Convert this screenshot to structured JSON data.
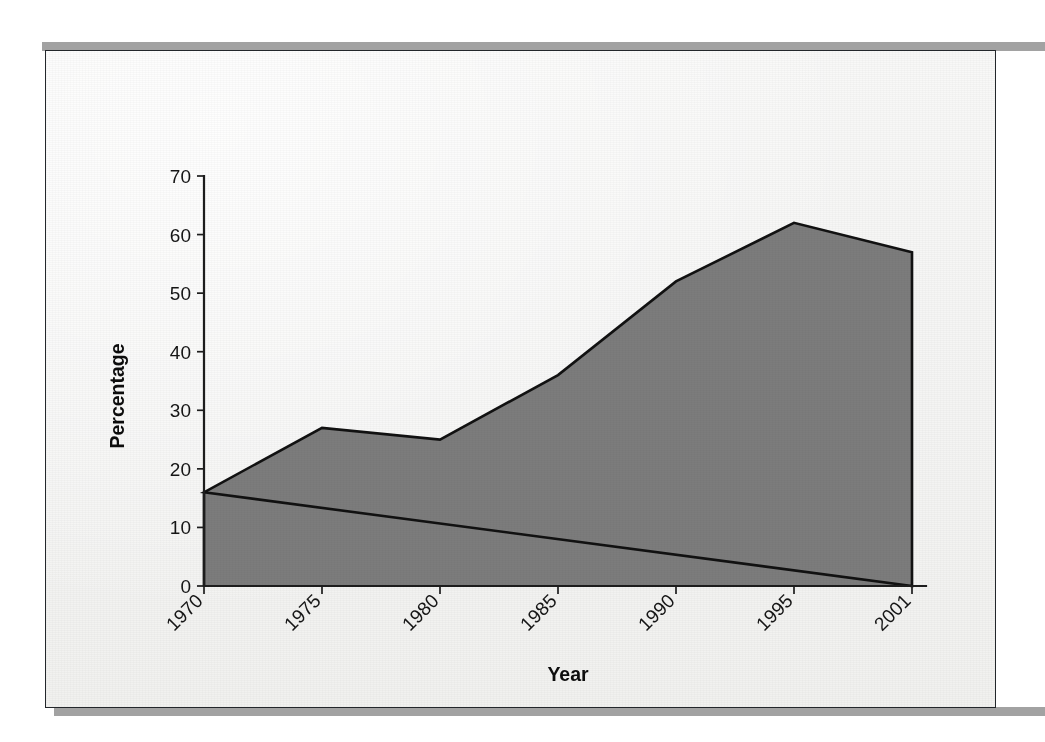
{
  "figure": {
    "caption_text": "",
    "frame_label": "scanned-figure-frame"
  },
  "page": {
    "bleed_text": "The expansion of secondary education across the region proceeded unevenly through the second half of the twentieth century, with the sharpest gains recorded between the mid nineteen eighties and the middle of the following decade. Enrolment ratios that had hovered near one sixth of the relevant age cohort at the start of the period had more than tripled by the end of it, although the rate of increase slowed noticeably after 1995 and a modest contraction is visible in the final years of the series. Several factors have been advanced to explain the pattern shown in the figure, including the removal of tuition charges, the construction of new schools in rural districts, and a steady decline in the opportunity cost of continued study. Comparable data for neighbouring countries suggest that the turning point observed here was part of a broader regional trend rather than a purely national phenomenon."
  },
  "chart_data": {
    "type": "area",
    "title": "",
    "xlabel": "Year",
    "ylabel": "Percentage",
    "categories": [
      "1970",
      "1975",
      "1980",
      "1985",
      "1990",
      "1995",
      "2001"
    ],
    "values": [
      16,
      27,
      25,
      36,
      52,
      62,
      57
    ],
    "ytick_labels": [
      "0",
      "10",
      "20",
      "30",
      "40",
      "50",
      "60",
      "70"
    ],
    "ytick_values": [
      0,
      10,
      20,
      30,
      40,
      50,
      60,
      70
    ],
    "ylim": [
      0,
      70
    ],
    "grid": false,
    "legend": "none",
    "series_name": "Percentage",
    "fill_color": "#7c7c7c",
    "line_color": "#111111",
    "axis_color": "#1d1d1d",
    "xtick_rotation_degrees": -45
  }
}
